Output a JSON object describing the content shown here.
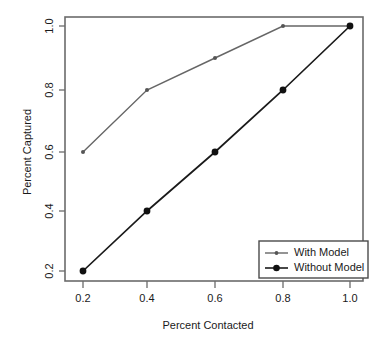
{
  "chart_data": {
    "type": "line",
    "title": "",
    "xlabel": "Percent Contacted",
    "ylabel": "Percent Captured",
    "xlim": [
      0.15,
      1.05
    ],
    "ylim": [
      0.15,
      1.05
    ],
    "grid": false,
    "legend_position": "bottom-right",
    "x": [
      0.2,
      0.4,
      0.6,
      0.8,
      1.0
    ],
    "xticks": [
      "0.2",
      "0.4",
      "0.6",
      "0.8",
      "1.0"
    ],
    "yticks": [
      "0.2",
      "0.4",
      "0.6",
      "0.8",
      "1.0"
    ],
    "series": [
      {
        "name": "With Model",
        "color": "#666666",
        "marker": "small-dot",
        "values": [
          0.6,
          0.8,
          0.9,
          1.0,
          1.0
        ]
      },
      {
        "name": "Without Model",
        "color": "#1a1a1a",
        "marker": "large-dot",
        "values": [
          0.2,
          0.4,
          0.6,
          0.8,
          1.0
        ]
      }
    ]
  },
  "axes": {
    "x_title": "Percent Contacted",
    "y_title": "Percent Captured",
    "x_tick_labels": [
      "0.2",
      "0.4",
      "0.6",
      "0.8",
      "1.0"
    ],
    "y_tick_labels": [
      "0.2",
      "0.4",
      "0.6",
      "0.8",
      "1.0"
    ]
  },
  "legend": {
    "entries": [
      {
        "label": "With Model"
      },
      {
        "label": "Without Model"
      }
    ]
  },
  "colors": {
    "with_model": "#666666",
    "without_model": "#1a1a1a",
    "frame": "#6b6b6b",
    "background": "#ffffff"
  }
}
